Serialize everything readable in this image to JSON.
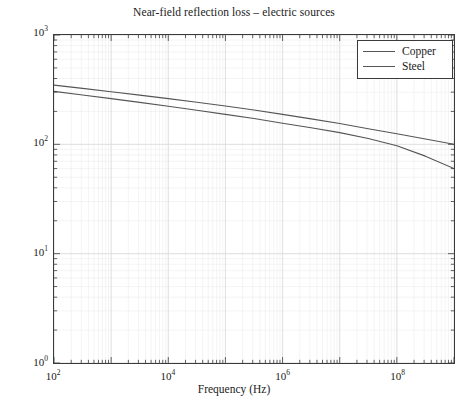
{
  "chart_data": {
    "type": "line",
    "title": "Near-field reflection loss – electric sources",
    "xlabel": "Frequency (Hz)",
    "ylabel": "Reflection loss (dB)",
    "xscale": "log",
    "yscale": "log",
    "xlim": [
      100,
      1000000000
    ],
    "ylim": [
      1,
      1000
    ],
    "grid": true,
    "grid_minor": true,
    "legend_position": "upper right",
    "xticks": [
      {
        "value": 100,
        "label": "10",
        "exponent": "2"
      },
      {
        "value": 10000,
        "label": "10",
        "exponent": "4"
      },
      {
        "value": 1000000,
        "label": "10",
        "exponent": "6"
      },
      {
        "value": 100000000,
        "label": "10",
        "exponent": "8"
      }
    ],
    "yticks": [
      {
        "value": 1000,
        "label": "10",
        "exponent": "3"
      },
      {
        "value": 100,
        "label": "10",
        "exponent": "2"
      },
      {
        "value": 10,
        "label": "10",
        "exponent": "1"
      },
      {
        "value": 1,
        "label": "10",
        "exponent": "0"
      }
    ],
    "series": [
      {
        "name": "Copper",
        "color": "#555555",
        "x": [
          100,
          316,
          1000,
          3160,
          10000,
          31600,
          100000,
          316000,
          1000000,
          3160000,
          10000000,
          31600000,
          100000000,
          316000000,
          1000000000
        ],
        "values": [
          348,
          325,
          303,
          282,
          262,
          243,
          224,
          206,
          188,
          171,
          155,
          139,
          125,
          112,
          100
        ]
      },
      {
        "name": "Steel",
        "color": "#555555",
        "x": [
          100,
          316,
          1000,
          3160,
          10000,
          31600,
          100000,
          316000,
          1000000,
          3160000,
          10000000,
          31600000,
          100000000,
          316000000,
          1000000000
        ],
        "values": [
          305,
          283,
          262,
          242,
          223,
          205,
          188,
          172,
          156,
          142,
          128,
          113,
          97,
          78,
          60
        ]
      }
    ]
  },
  "legend": {
    "items": [
      {
        "label": "Copper"
      },
      {
        "label": "Steel"
      }
    ]
  }
}
